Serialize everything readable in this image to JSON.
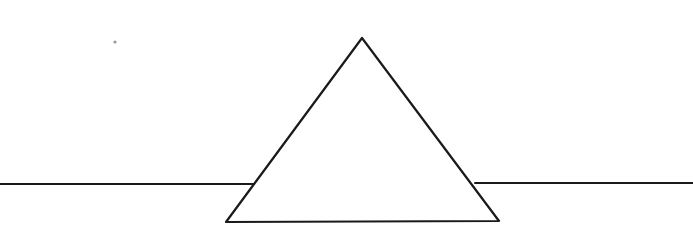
{
  "drawing": {
    "background": "#ffffff",
    "stroke_color": "#1a1a1a",
    "horizon_line": {
      "left_segment": {
        "x1": 0,
        "y1": 184,
        "x2": 253,
        "y2": 184
      },
      "right_segment": {
        "x1": 475,
        "y1": 183,
        "x2": 693,
        "y2": 183
      }
    },
    "triangle": {
      "apex": [
        362,
        38
      ],
      "bottom_left": [
        226,
        222
      ],
      "bottom_right": [
        499,
        221
      ]
    },
    "dot": {
      "x": 115,
      "y": 42,
      "color": "#999999"
    }
  }
}
